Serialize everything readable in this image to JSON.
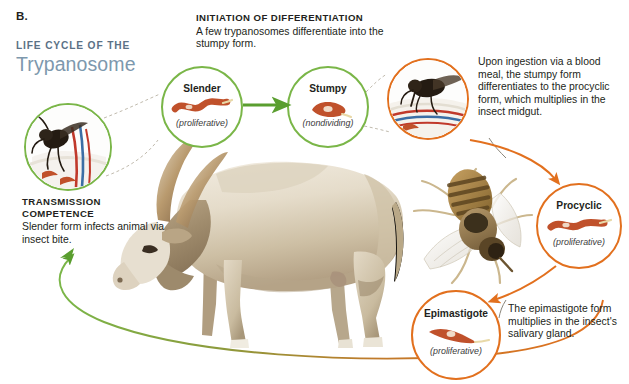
{
  "figure": {
    "panel_letter": "B.",
    "title_kicker": "LIFE CYCLE OF THE",
    "title_main": "Trypanosome"
  },
  "colors": {
    "mammalian_stage": "#7ab648",
    "insect_stage": "#e2701e",
    "title_kicker": "#5b7186",
    "title_main": "#7d98ad",
    "text": "#231f20",
    "background": "#ffffff"
  },
  "callouts": {
    "initiation": {
      "heading": "INITIATION OF DIFFERENTIATION",
      "body": "A few trypanosomes differentiate into the stumpy form."
    },
    "transmission": {
      "heading_line1": "TRANSMISSION",
      "heading_line2": "COMPETENCE",
      "body": "Slender form infects animal via insect bite."
    },
    "ingestion": {
      "body": "Upon ingestion via a blood meal, the stumpy form differentiates to the procyclic form, which multiplies in the insect midgut."
    },
    "salivary": {
      "body": "The epimastigote form multiplies in the insect's salivary gland."
    }
  },
  "stages": [
    {
      "id": "slender",
      "label": "Slender",
      "sublabel": "(proliferative)",
      "ring": "green"
    },
    {
      "id": "stumpy",
      "label": "Stumpy",
      "sublabel": "(nondividing)",
      "ring": "green"
    },
    {
      "id": "procyclic",
      "label": "Procyclic",
      "sublabel": "(proliferative)",
      "ring": "orange"
    },
    {
      "id": "epimastigote",
      "label": "Epimastigote",
      "sublabel": "(proliferative)",
      "ring": "orange"
    }
  ],
  "images": {
    "cow": "cow-photograph",
    "tsetse_fly": "tsetse-fly-photograph",
    "insect_bite_inset": "tsetse-fly-biting-skin-illustration",
    "fly_feeding_inset": "tsetse-fly-feeding-on-skin-illustration"
  },
  "arrows": {
    "slender_to_stumpy": "green-straight-arrow",
    "stumpy_to_procyclic": "orange-curved-arrow",
    "procyclic_to_epimastigote": "orange-straight-arrow",
    "epimastigote_to_mammal": "green-orange-cycle-arc"
  }
}
